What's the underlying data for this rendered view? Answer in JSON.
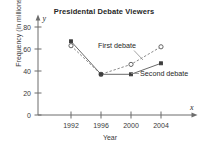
{
  "chart_data": {
    "type": "line",
    "title": "Presidental  Debate Viewers",
    "xlabel": "Year",
    "ylabel": "Frequency (in millions)",
    "x_axis_symbol": "x",
    "y_axis_symbol": "y",
    "categories": [
      "1992",
      "1996",
      "2000",
      "2004"
    ],
    "x": [
      1992,
      1996,
      2000,
      2004
    ],
    "xlim": [
      1990,
      2006
    ],
    "ylim": [
      0,
      88
    ],
    "yticks": [
      0,
      20,
      40,
      60,
      80
    ],
    "ytick_labels": [
      "0",
      "20",
      "40",
      "60",
      "80"
    ],
    "xtick_labels": [
      "1992",
      "1996",
      "2000",
      "2004"
    ],
    "grid": false,
    "legend_position": "inline-annotations",
    "series": [
      {
        "name": "First debate",
        "values": [
          63,
          37,
          46,
          62
        ],
        "marker": "open-circle",
        "linestyle": "dashed",
        "color": "#8a8a8a"
      },
      {
        "name": "Second debate",
        "values": [
          67,
          37,
          37,
          47
        ],
        "marker": "filled-square",
        "linestyle": "solid",
        "color": "#6a6a6a"
      }
    ],
    "annotations": [
      {
        "text": "First debate",
        "series": "First debate"
      },
      {
        "text": "Second debate",
        "series": "Second debate"
      }
    ]
  }
}
